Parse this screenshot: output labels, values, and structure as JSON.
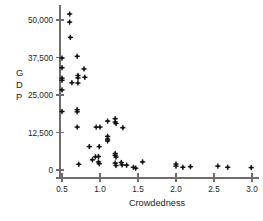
{
  "chart_data": {
    "type": "scatter",
    "title": "",
    "xlabel": "Crowdedness",
    "ylabel": "GDP",
    "ylabel_letters": [
      "G",
      "D",
      "P"
    ],
    "xlim": [
      0.42,
      3.08
    ],
    "ylim": [
      -1800,
      54500
    ],
    "xticks": [
      0.5,
      1.0,
      1.5,
      2.0,
      2.5,
      3.0
    ],
    "xticklabels": [
      "0.5",
      "1.0",
      "1.5",
      "2.0",
      "2.5",
      "3.0"
    ],
    "yticks": [
      0,
      12500,
      25000,
      37500,
      50000
    ],
    "yticklabels": [
      "0",
      "12,500",
      "25,000",
      "37,500",
      "50,000"
    ],
    "grid": false,
    "legend": false,
    "marker": "plus-dot",
    "marker_color": "#141414",
    "axis_color": "#6d6d6d",
    "points": [
      {
        "x": 0.6,
        "y": 52000
      },
      {
        "x": 0.6,
        "y": 49300
      },
      {
        "x": 0.61,
        "y": 44200
      },
      {
        "x": 0.7,
        "y": 37900
      },
      {
        "x": 0.5,
        "y": 37300
      },
      {
        "x": 0.5,
        "y": 34100
      },
      {
        "x": 0.79,
        "y": 33700
      },
      {
        "x": 0.71,
        "y": 31500
      },
      {
        "x": 0.8,
        "y": 30900
      },
      {
        "x": 0.5,
        "y": 30600
      },
      {
        "x": 0.5,
        "y": 29900
      },
      {
        "x": 0.71,
        "y": 30700
      },
      {
        "x": 0.63,
        "y": 29100
      },
      {
        "x": 0.71,
        "y": 29000
      },
      {
        "x": 0.5,
        "y": 26700
      },
      {
        "x": 0.5,
        "y": 19500
      },
      {
        "x": 0.7,
        "y": 20100
      },
      {
        "x": 0.7,
        "y": 19400
      },
      {
        "x": 0.7,
        "y": 14300
      },
      {
        "x": 0.95,
        "y": 14300
      },
      {
        "x": 1.0,
        "y": 14300
      },
      {
        "x": 1.1,
        "y": 16300
      },
      {
        "x": 1.2,
        "y": 17100
      },
      {
        "x": 1.2,
        "y": 16000
      },
      {
        "x": 1.21,
        "y": 15500
      },
      {
        "x": 1.3,
        "y": 14100
      },
      {
        "x": 1.1,
        "y": 11200
      },
      {
        "x": 1.1,
        "y": 10300
      },
      {
        "x": 1.1,
        "y": 9700
      },
      {
        "x": 0.86,
        "y": 7800
      },
      {
        "x": 0.99,
        "y": 7800
      },
      {
        "x": 1.2,
        "y": 5500
      },
      {
        "x": 1.2,
        "y": 4900
      },
      {
        "x": 1.21,
        "y": 4300
      },
      {
        "x": 0.94,
        "y": 4400
      },
      {
        "x": 0.98,
        "y": 4500
      },
      {
        "x": 0.9,
        "y": 3400
      },
      {
        "x": 0.98,
        "y": 2700
      },
      {
        "x": 0.99,
        "y": 2100
      },
      {
        "x": 1.2,
        "y": 2300
      },
      {
        "x": 1.21,
        "y": 1500
      },
      {
        "x": 1.28,
        "y": 2500
      },
      {
        "x": 1.29,
        "y": 1700
      },
      {
        "x": 1.35,
        "y": 1600
      },
      {
        "x": 1.44,
        "y": 900
      },
      {
        "x": 1.47,
        "y": 600
      },
      {
        "x": 1.56,
        "y": 2700
      },
      {
        "x": 0.72,
        "y": 1900
      },
      {
        "x": 2.0,
        "y": 2000
      },
      {
        "x": 2.0,
        "y": 1300
      },
      {
        "x": 2.09,
        "y": 900
      },
      {
        "x": 2.19,
        "y": 1100
      },
      {
        "x": 2.55,
        "y": 1300
      },
      {
        "x": 2.68,
        "y": 900
      },
      {
        "x": 2.99,
        "y": 800
      }
    ]
  },
  "axes": {
    "x_title": "Crowdedness",
    "y_title": "GDP"
  }
}
